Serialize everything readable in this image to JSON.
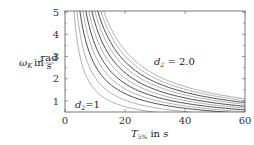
{
  "chart_data": {
    "type": "line",
    "title": "",
    "xlabel": "T_5% in s",
    "ylabel": "ω_K in rad/s",
    "xlim": [
      0,
      60
    ],
    "ylim": [
      0.5,
      5
    ],
    "x_ticks": [
      0,
      20,
      40,
      60
    ],
    "y_ticks": [
      1,
      2,
      3,
      4,
      5
    ],
    "grid": false,
    "legend": "none",
    "annotations": [
      {
        "text": "d2=1",
        "x": 3,
        "y": 1.0
      },
      {
        "text": "d2 = 2.0",
        "x": 27,
        "y": 2.3
      }
    ],
    "series_param": "d2",
    "series": [
      {
        "name": "d2=1.0",
        "shade": "light",
        "x": [
          3,
          5,
          10,
          20,
          30,
          40,
          50,
          60
        ],
        "values": [
          5.0,
          3.0,
          1.5,
          0.75,
          0.5,
          0.375,
          0.3,
          0.25
        ]
      },
      {
        "name": "d2=1.1",
        "shade": "light",
        "x": [
          4,
          5,
          10,
          20,
          30,
          40,
          50,
          60
        ],
        "values": [
          5.0,
          4.0,
          2.0,
          1.0,
          0.67,
          0.5,
          0.4,
          0.35
        ]
      },
      {
        "name": "d2=1.2",
        "shade": "dark",
        "x": [
          5,
          10,
          20,
          30,
          40,
          50,
          60
        ],
        "values": [
          5.0,
          2.5,
          1.25,
          0.83,
          0.63,
          0.52,
          0.45
        ]
      },
      {
        "name": "d2=1.3",
        "shade": "light",
        "x": [
          6,
          10,
          20,
          30,
          40,
          50,
          60
        ],
        "values": [
          5.0,
          3.0,
          1.5,
          1.0,
          0.75,
          0.6,
          0.52
        ]
      },
      {
        "name": "d2=1.4",
        "shade": "dark",
        "x": [
          7,
          10,
          20,
          30,
          40,
          50,
          60
        ],
        "values": [
          5.0,
          3.5,
          1.75,
          1.17,
          0.88,
          0.7,
          0.6
        ]
      },
      {
        "name": "d2=1.5",
        "shade": "light",
        "x": [
          8,
          10,
          20,
          30,
          40,
          50,
          60
        ],
        "values": [
          5.0,
          4.0,
          2.0,
          1.33,
          1.0,
          0.8,
          0.68
        ]
      },
      {
        "name": "d2=1.6",
        "shade": "dark",
        "x": [
          9,
          10,
          20,
          30,
          40,
          50,
          60
        ],
        "values": [
          5.0,
          4.5,
          2.25,
          1.5,
          1.13,
          0.9,
          0.76
        ]
      },
      {
        "name": "d2=1.7",
        "shade": "light",
        "x": [
          10,
          20,
          30,
          40,
          50,
          60
        ],
        "values": [
          5.0,
          2.5,
          1.67,
          1.25,
          1.0,
          0.85
        ]
      },
      {
        "name": "d2=1.8",
        "shade": "dark",
        "x": [
          11,
          20,
          30,
          40,
          50,
          60
        ],
        "values": [
          5.0,
          2.75,
          1.83,
          1.38,
          1.1,
          0.93
        ]
      },
      {
        "name": "d2=1.9",
        "shade": "light",
        "x": [
          12,
          20,
          30,
          40,
          50,
          60
        ],
        "values": [
          5.0,
          3.0,
          2.0,
          1.5,
          1.2,
          1.02
        ]
      },
      {
        "name": "d2=2.0",
        "shade": "light",
        "x": [
          13,
          20,
          30,
          40,
          50,
          60
        ],
        "values": [
          5.0,
          3.25,
          2.17,
          1.63,
          1.3,
          1.1
        ]
      }
    ]
  },
  "labels": {
    "y_omega": "ω",
    "y_sub": "K",
    "y_in": " in ",
    "y_unit_num": "rad",
    "y_unit_den": "s",
    "x_T": "T",
    "x_sub": "5%",
    "x_in": " in ",
    "x_unit": "s",
    "ann_low_d": "d",
    "ann_low_sub": "2",
    "ann_low_val": "=1",
    "ann_high_d": "d",
    "ann_high_sub": "2",
    "ann_high_val": " = 2.0",
    "ticks_x": [
      "0",
      "20",
      "40",
      "60"
    ],
    "ticks_y": [
      "1",
      "2",
      "3",
      "4",
      "5"
    ]
  },
  "colors": {
    "dark": "#3a3a3a",
    "light": "#a8a8a8",
    "axis": "#555555"
  }
}
